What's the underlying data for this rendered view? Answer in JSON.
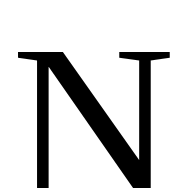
{
  "letter": {
    "text": "N",
    "color": "#000000"
  },
  "background": "#ffffff"
}
